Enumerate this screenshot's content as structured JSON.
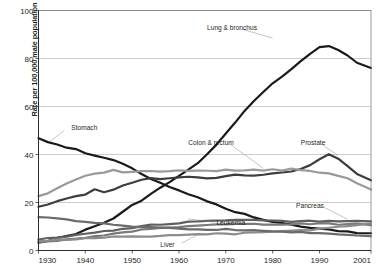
{
  "chart_data": {
    "type": "line",
    "title": "",
    "subtitle": "",
    "xlabel": "",
    "ylabel": "Rate per 100,000 male population",
    "xlim": [
      1930,
      2001
    ],
    "ylim": [
      0,
      100
    ],
    "ytick_values": [
      0,
      20,
      40,
      60,
      80,
      100
    ],
    "ytick_labels": [
      "0",
      "20",
      "40",
      "60",
      "80",
      "100"
    ],
    "xtick_values": [
      1930,
      1940,
      1950,
      1960,
      1970,
      1980,
      1990,
      2001
    ],
    "xtick_labels": [
      "1930",
      "1940",
      "1950",
      "1960",
      "1970",
      "1980",
      "1990",
      "2001"
    ],
    "grid": "horizontal",
    "legend": "inline-annotations",
    "x": [
      1930,
      1932,
      1934,
      1936,
      1938,
      1940,
      1942,
      1944,
      1946,
      1948,
      1950,
      1952,
      1954,
      1956,
      1958,
      1960,
      1962,
      1964,
      1966,
      1968,
      1970,
      1972,
      1974,
      1976,
      1978,
      1980,
      1982,
      1984,
      1986,
      1988,
      1990,
      1992,
      1994,
      1996,
      1998,
      2001
    ],
    "series": [
      {
        "name": "Lung & bronchus",
        "color": "#1a1a1a",
        "label_x": 1966,
        "label_y": 93,
        "values": [
          3.5,
          4.2,
          5.0,
          6.0,
          7.1,
          8.5,
          10.0,
          11.6,
          13.4,
          16.0,
          18.8,
          21.0,
          23.5,
          26.0,
          28.5,
          31.0,
          33.5,
          36.5,
          40.0,
          44.0,
          48.5,
          53.5,
          58.0,
          62.5,
          66.0,
          69.5,
          72.5,
          75.5,
          79.0,
          82.0,
          84.5,
          85.0,
          83.5,
          81.0,
          78.5,
          76.0
        ]
      },
      {
        "name": "Stomach",
        "color": "#1a1a1a",
        "label_x": 1937,
        "label_y": 51,
        "values": [
          46.5,
          45.0,
          44.0,
          43.0,
          42.0,
          40.5,
          39.5,
          38.5,
          37.5,
          36.0,
          34.0,
          32.0,
          30.0,
          28.0,
          26.5,
          25.0,
          23.5,
          22.0,
          20.5,
          19.0,
          17.5,
          16.0,
          15.0,
          14.0,
          13.0,
          12.0,
          11.2,
          10.5,
          10.0,
          9.4,
          9.0,
          8.6,
          8.2,
          7.8,
          7.4,
          7.0
        ]
      },
      {
        "name": "Prostate",
        "color": "#3d3d3d",
        "label_x": 1986,
        "label_y": 45,
        "values": [
          18.0,
          19.2,
          20.5,
          21.5,
          22.5,
          23.5,
          25.5,
          24.5,
          25.5,
          27.0,
          28.5,
          29.5,
          30.0,
          30.0,
          30.2,
          30.5,
          30.5,
          30.5,
          30.2,
          30.5,
          31.0,
          31.5,
          31.5,
          31.5,
          31.5,
          32.0,
          32.5,
          33.0,
          34.0,
          35.5,
          38.0,
          40.0,
          38.0,
          35.0,
          32.0,
          29.5
        ]
      },
      {
        "name": "Colon & rectum",
        "color": "#9a9a9a",
        "label_x": 1962,
        "label_y": 45,
        "values": [
          22.5,
          24.0,
          26.0,
          28.0,
          29.5,
          31.0,
          32.0,
          32.5,
          33.5,
          32.5,
          33.0,
          33.0,
          33.2,
          33.0,
          33.2,
          33.5,
          33.2,
          33.5,
          33.5,
          33.2,
          33.5,
          33.5,
          33.5,
          33.5,
          33.5,
          34.0,
          33.5,
          34.0,
          33.5,
          33.0,
          32.5,
          32.0,
          31.0,
          30.0,
          28.0,
          25.5
        ]
      },
      {
        "name": "Pancreas",
        "color": "#5f5f5f",
        "label_x": 1985,
        "label_y": 18.5,
        "values": [
          4.5,
          5.0,
          5.5,
          6.0,
          6.5,
          7.0,
          7.5,
          8.0,
          8.5,
          9.0,
          9.5,
          10.0,
          10.5,
          10.8,
          11.2,
          11.5,
          11.8,
          12.0,
          12.2,
          12.5,
          12.8,
          12.8,
          12.8,
          12.6,
          12.5,
          12.4,
          12.3,
          12.2,
          12.2,
          12.2,
          12.2,
          12.2,
          12.2,
          12.2,
          12.2,
          12.2
        ]
      },
      {
        "name": "Leukemia",
        "color": "#7a7a7a",
        "label_x": 1968,
        "label_y": 11.5,
        "values": [
          3.5,
          3.8,
          4.2,
          4.6,
          5.0,
          5.5,
          6.0,
          6.5,
          7.0,
          7.5,
          8.0,
          8.5,
          9.0,
          9.4,
          9.8,
          10.0,
          10.2,
          10.5,
          10.6,
          10.8,
          11.0,
          11.0,
          11.0,
          11.0,
          11.0,
          11.0,
          11.0,
          11.0,
          11.2,
          11.2,
          11.2,
          11.2,
          11.0,
          11.0,
          11.0,
          10.5
        ]
      },
      {
        "name": "Liver",
        "color": "#8c8c8c",
        "label_x": 1956,
        "label_y": 2.5,
        "values": [
          4.0,
          4.2,
          4.4,
          4.6,
          4.8,
          5.0,
          5.2,
          5.4,
          5.6,
          5.8,
          6.0,
          6.0,
          6.0,
          6.0,
          6.2,
          6.2,
          6.4,
          6.6,
          6.8,
          7.0,
          7.0,
          7.0,
          7.2,
          7.4,
          7.6,
          7.8,
          8.0,
          8.2,
          8.4,
          8.6,
          9.0,
          9.4,
          9.8,
          10.2,
          10.8,
          11.2
        ]
      },
      {
        "name": "Other declining",
        "color": "#6b6b6b",
        "label_x": null,
        "label_y": null,
        "values": [
          14.0,
          13.5,
          13.2,
          12.8,
          12.5,
          12.0,
          11.6,
          11.2,
          10.8,
          10.4,
          10.0,
          9.8,
          9.6,
          9.4,
          9.2,
          9.0,
          8.8,
          8.8,
          8.8,
          8.8,
          8.8,
          8.6,
          8.6,
          8.4,
          8.4,
          8.2,
          8.0,
          7.8,
          7.6,
          7.4,
          7.2,
          7.0,
          6.8,
          6.6,
          6.4,
          6.2
        ]
      }
    ]
  }
}
